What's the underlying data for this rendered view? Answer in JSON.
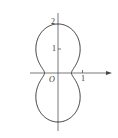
{
  "figure": {
    "labels": {
      "y_tick_2": "2",
      "y_tick_1": "1",
      "origin": "O",
      "x_tick_1": "1"
    },
    "curve": {
      "r_at_0_deg": 0.55,
      "r_at_90_deg": 2,
      "formula": "r = 0.55 + 1.45*sin^2(theta)"
    },
    "axes": {
      "origin_px": [
        58,
        73
      ],
      "unit_px": 24.5,
      "x_range_px": [
        30,
        111
      ],
      "y_range_px": [
        13,
        131
      ]
    },
    "colors": {
      "curve": "#333333",
      "axis": "#555555"
    }
  }
}
